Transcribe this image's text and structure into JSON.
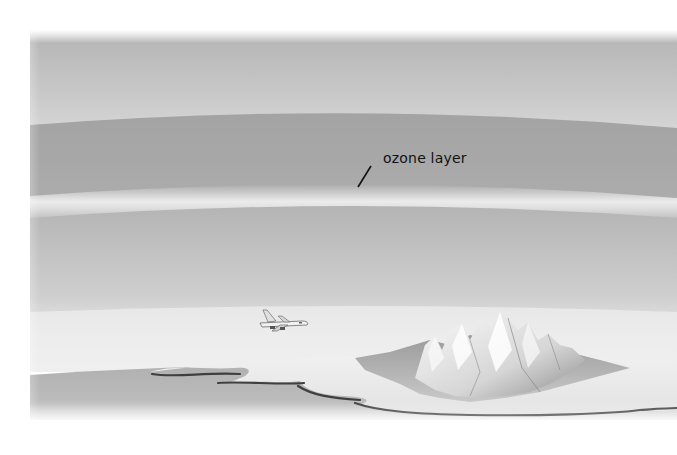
{
  "diagram": {
    "type": "atmosphere-illustration",
    "labels": [
      {
        "id": "ozone",
        "text": "ozone layer"
      }
    ],
    "elements": [
      "upper-atmosphere-band",
      "stratosphere-band",
      "ozone-layer-band",
      "lower-atmosphere-band",
      "airplane",
      "sea",
      "land-coastline",
      "mountain-range"
    ],
    "colors": {
      "sky_top": "#b9b9b9",
      "sky_light": "#d8d8d8",
      "stratosphere": "#a6a6a6",
      "ozone": "#e6e6e6",
      "troposphere": "#c4c4c4",
      "horizon": "#eeeeee",
      "sea": "#b3b3b3",
      "land": "#e9e9e9",
      "coastline": "#444444",
      "label_text": "#111111"
    }
  }
}
